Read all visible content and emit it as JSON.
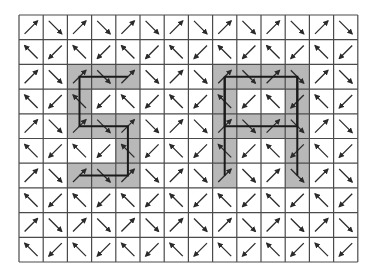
{
  "diagram": {
    "type": "vector-field-grid",
    "grid": {
      "rows": 10,
      "cols": 14,
      "origin_x": 19,
      "origin_y": 15,
      "cell_width": 24.2,
      "cell_height": 24.7,
      "line_color": "#4a4a4a",
      "background": "#ffffff"
    },
    "arrow_pattern": {
      "description": "Each cell holds one diagonal arrow. Even rows alternate NE / SE; odd rows alternate NW / SW.",
      "even_row": [
        "ne",
        "se"
      ],
      "odd_row": [
        "nw",
        "sw"
      ],
      "color": "#2a2a2a"
    },
    "highlight": {
      "fill": "#b8b8b8",
      "shapes": [
        {
          "name": "digit-5",
          "cells": [
            [
              2,
              2
            ],
            [
              2,
              3
            ],
            [
              2,
              4
            ],
            [
              3,
              2
            ],
            [
              4,
              2
            ],
            [
              4,
              3
            ],
            [
              4,
              4
            ],
            [
              5,
              4
            ],
            [
              6,
              2
            ],
            [
              6,
              3
            ],
            [
              6,
              4
            ]
          ]
        },
        {
          "name": "letter-A",
          "cells": [
            [
              2,
              8
            ],
            [
              2,
              9
            ],
            [
              2,
              10
            ],
            [
              2,
              11
            ],
            [
              3,
              8
            ],
            [
              3,
              11
            ],
            [
              4,
              8
            ],
            [
              4,
              9
            ],
            [
              4,
              10
            ],
            [
              4,
              11
            ],
            [
              5,
              8
            ],
            [
              5,
              11
            ],
            [
              6,
              8
            ],
            [
              6,
              11
            ]
          ]
        }
      ]
    },
    "paths": {
      "color": "#1a1a1a",
      "width": 2,
      "polylines": [
        {
          "name": "path-5",
          "points": [
            [
              2,
              4
            ],
            [
              2,
              2
            ],
            [
              4,
              2
            ],
            [
              4,
              4
            ],
            [
              6,
              4
            ],
            [
              6,
              2
            ]
          ]
        },
        {
          "name": "path-A-loop",
          "points": [
            [
              2,
              8
            ],
            [
              2,
              11
            ],
            [
              4,
              11
            ],
            [
              4,
              8
            ],
            [
              2,
              8
            ]
          ]
        },
        {
          "name": "path-A-left-leg",
          "points": [
            [
              2,
              8
            ],
            [
              6,
              8
            ]
          ]
        },
        {
          "name": "path-A-right-leg",
          "points": [
            [
              2,
              11
            ],
            [
              6,
              11
            ]
          ]
        }
      ]
    }
  }
}
